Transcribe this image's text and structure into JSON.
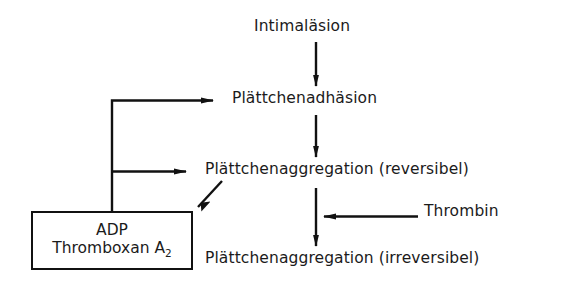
{
  "diagram": {
    "title_text": "Intimaläsion",
    "background_color": "#ffffff",
    "ink_color": "#111111",
    "nodes": {
      "intimalaesion": "Intimaläsion",
      "adhaesion": "Plättchenadhäsion",
      "aggregation_reversible": "Plättchenaggregation (reversibel)",
      "aggregation_irreversible": "Plättchenaggregation (irreversibel)",
      "thrombin": "Thrombin"
    },
    "factor_box": {
      "line_1": "ADP",
      "line_2_main": "Thromboxan A",
      "line_2_subscript": "2"
    },
    "edges": [
      {
        "id": "intimalaesion-to-adhaesion",
        "from": "Intimaläsion",
        "to": "Plättchenadhäsion",
        "direction": "down",
        "arrowhead": "filled"
      },
      {
        "id": "adhaesion-to-aggregation-reversible",
        "from": "Plättchenadhäsion",
        "to": "Plättchenaggregation (reversibel)",
        "direction": "down",
        "arrowhead": "filled"
      },
      {
        "id": "aggregation-reversible-to-irreversible",
        "from": "Plättchenaggregation (reversibel)",
        "to": "Plättchenaggregation (irreversibel)",
        "direction": "down",
        "arrowhead": "filled"
      },
      {
        "id": "thrombin-to-aggregation",
        "from": "Thrombin",
        "to": "Plättchenaggregation (irreversibel)",
        "direction": "left",
        "arrowhead": "filled"
      },
      {
        "id": "aggregation-reversible-to-factor-box",
        "from": "Plättchenaggregation (reversibel)",
        "to": "ADP / Thromboxan A2",
        "direction": "diagonal-down-left",
        "arrowhead": "filled"
      },
      {
        "id": "factor-box-to-adhaesion",
        "from": "ADP / Thromboxan A2",
        "to": "Plättchenadhäsion",
        "direction": "feedback-up-right",
        "arrowhead": "filled"
      },
      {
        "id": "factor-box-to-aggregation-reversible",
        "from": "ADP / Thromboxan A2",
        "to": "Plättchenaggregation (reversibel)",
        "direction": "feedback-right",
        "arrowhead": "filled"
      }
    ]
  }
}
